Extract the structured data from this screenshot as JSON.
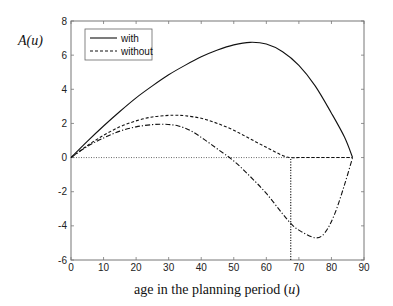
{
  "chart_data": {
    "type": "line",
    "title": "",
    "xlabel": "age in the planning period (u)",
    "ylabel": "A(u)",
    "xlim": [
      0,
      90
    ],
    "ylim": [
      -6,
      8
    ],
    "xticks": [
      0,
      10,
      20,
      30,
      40,
      50,
      60,
      70,
      80,
      90
    ],
    "yticks": [
      -6,
      -4,
      -2,
      0,
      2,
      4,
      6,
      8
    ],
    "grid": false,
    "legend_position": "upper left",
    "legend": [
      "with",
      "without"
    ],
    "series": [
      {
        "name": "with",
        "style": "solid",
        "x": [
          0,
          5,
          10,
          15,
          20,
          25,
          30,
          35,
          40,
          45,
          50,
          55,
          60,
          65,
          70,
          75,
          80,
          84,
          86.5
        ],
        "y": [
          0,
          0.95,
          1.85,
          2.7,
          3.5,
          4.2,
          4.85,
          5.4,
          5.9,
          6.3,
          6.6,
          6.75,
          6.65,
          6.2,
          5.4,
          4.2,
          2.6,
          1.2,
          0
        ]
      },
      {
        "name": "without",
        "style": "dashed",
        "x": [
          0,
          5,
          10,
          15,
          20,
          25,
          30,
          32,
          35,
          40,
          45,
          50,
          55,
          60,
          65,
          67.5,
          70,
          75,
          80,
          86.5
        ],
        "y": [
          0,
          0.7,
          1.3,
          1.8,
          2.15,
          2.38,
          2.47,
          2.48,
          2.45,
          2.3,
          2.0,
          1.6,
          1.1,
          0.6,
          0.12,
          0,
          0,
          0,
          0,
          0
        ]
      },
      {
        "name": "without (unconstrained)",
        "style": "dashdot",
        "x": [
          0,
          5,
          10,
          15,
          20,
          25,
          29,
          33,
          37,
          41,
          45,
          50,
          55,
          60,
          65,
          67.5,
          70,
          75,
          78,
          81,
          84,
          86.5
        ],
        "y": [
          0,
          0.65,
          1.15,
          1.55,
          1.8,
          1.93,
          1.95,
          1.85,
          1.55,
          1.05,
          0.5,
          -0.2,
          -1.1,
          -2.1,
          -3.3,
          -3.85,
          -4.25,
          -4.7,
          -4.4,
          -3.3,
          -1.6,
          0
        ]
      }
    ],
    "annotations": [
      {
        "type": "hline",
        "y": 0,
        "style": "dotted",
        "x_range": [
          0,
          86.5
        ]
      },
      {
        "type": "vline",
        "x": 67.5,
        "style": "dotted",
        "y_range": [
          -6,
          0
        ]
      }
    ]
  },
  "labels": {
    "ylabel": "A(u)",
    "xlabel_prefix": "age in the planning period (",
    "xlabel_var": "u",
    "xlabel_suffix": ")",
    "legend_with": "with",
    "legend_without": "without"
  }
}
